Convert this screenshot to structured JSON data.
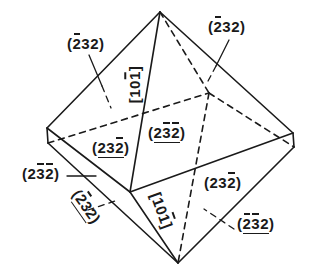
{
  "figure": {
    "type": "crystal-habit-drawing",
    "stroke_color": "#1a1a1a",
    "background": "#ffffff"
  },
  "vertices": {
    "top": [
      160,
      12
    ],
    "bottom": [
      178,
      263
    ],
    "left_upper": [
      47,
      128
    ],
    "left_lower": [
      48,
      143
    ],
    "right_upper": [
      293,
      133
    ],
    "right_lower": [
      294,
      147
    ],
    "front": [
      130,
      192
    ],
    "back_hidden": [
      209,
      93
    ]
  },
  "labels": [
    {
      "id": "face-top-left",
      "kind": "face",
      "text": "(2̄32)",
      "digits": [
        {
          "c": "2",
          "bar": true
        },
        {
          "c": "3",
          "bar": false
        },
        {
          "c": "2",
          "bar": false
        }
      ],
      "underlined": false,
      "x": 67,
      "y": 36,
      "rotate": 0
    },
    {
      "id": "face-top-right",
      "kind": "face",
      "text": "(2̄32)",
      "digits": [
        {
          "c": "2",
          "bar": true
        },
        {
          "c": "3",
          "bar": false
        },
        {
          "c": "2",
          "bar": false
        }
      ],
      "underlined": false,
      "x": 208,
      "y": 19,
      "rotate": 0
    },
    {
      "id": "edge-upper",
      "kind": "direction",
      "text": "[101̄]",
      "digits": [
        {
          "c": "1",
          "bar": false
        },
        {
          "c": "0",
          "bar": false
        },
        {
          "c": "1",
          "bar": true
        }
      ],
      "underlined": false,
      "x": 116,
      "y": 77,
      "rotate": -90
    },
    {
      "id": "face-center-left",
      "kind": "face",
      "text": "(232̄)",
      "digits": [
        {
          "c": "2",
          "bar": false
        },
        {
          "c": "3",
          "bar": false
        },
        {
          "c": "2",
          "bar": true
        }
      ],
      "underlined": true,
      "x": 92,
      "y": 140,
      "rotate": 0
    },
    {
      "id": "face-center",
      "kind": "face",
      "text": "(23̄2̄)",
      "digits": [
        {
          "c": "2",
          "bar": false
        },
        {
          "c": "3",
          "bar": true
        },
        {
          "c": "2",
          "bar": true
        }
      ],
      "underlined": true,
      "x": 148,
      "y": 125,
      "rotate": 0
    },
    {
      "id": "face-left",
      "kind": "face",
      "text": "(23̄2̄)",
      "digits": [
        {
          "c": "2",
          "bar": false
        },
        {
          "c": "3",
          "bar": true
        },
        {
          "c": "2",
          "bar": true
        }
      ],
      "underlined": false,
      "x": 22,
      "y": 166,
      "rotate": 0
    },
    {
      "id": "face-bottom-left",
      "kind": "face",
      "text": "(2̄32)",
      "digits": [
        {
          "c": "2",
          "bar": true
        },
        {
          "c": "3",
          "bar": false
        },
        {
          "c": "2",
          "bar": false
        }
      ],
      "underlined": true,
      "x": 68,
      "y": 199,
      "rotate": 55
    },
    {
      "id": "edge-lower",
      "kind": "direction",
      "text": "[101̄]",
      "digits": [
        {
          "c": "1",
          "bar": false
        },
        {
          "c": "0",
          "bar": false
        },
        {
          "c": "1",
          "bar": true
        }
      ],
      "underlined": false,
      "x": 143,
      "y": 203,
      "rotate": 70
    },
    {
      "id": "face-lower-right",
      "kind": "face",
      "text": "(232̄)",
      "digits": [
        {
          "c": "2",
          "bar": false
        },
        {
          "c": "3",
          "bar": false
        },
        {
          "c": "2",
          "bar": true
        }
      ],
      "underlined": false,
      "x": 204,
      "y": 175,
      "rotate": 0
    },
    {
      "id": "face-bottom-right",
      "kind": "face",
      "text": "(2̄3̄2)",
      "digits": [
        {
          "c": "2",
          "bar": true
        },
        {
          "c": "3",
          "bar": true
        },
        {
          "c": "2",
          "bar": false
        }
      ],
      "underlined": true,
      "x": 237,
      "y": 216,
      "rotate": 0
    }
  ]
}
